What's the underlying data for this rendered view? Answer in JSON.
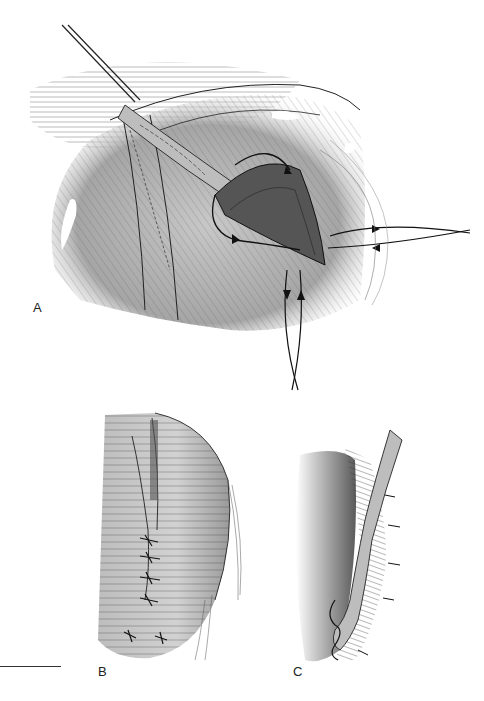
{
  "figure": {
    "panels": [
      {
        "id": "A",
        "label": "A",
        "description": "Operative view: incision with purse-string suture around tube/duct, forceps holding structure, suture ends with directional arrows"
      },
      {
        "id": "B",
        "label": "B",
        "description": "Closed incision with interrupted sutures along linear closure"
      },
      {
        "id": "C",
        "label": "C",
        "description": "Cross-section of tube passing through layered tissue wall with sutures"
      }
    ],
    "scale_bar": {
      "visible": true
    },
    "colors": {
      "line": "#1a1a1a",
      "tissue_fill": "#b8b8b8",
      "tissue_dark": "#6a6a6a",
      "background": "#ffffff"
    }
  }
}
